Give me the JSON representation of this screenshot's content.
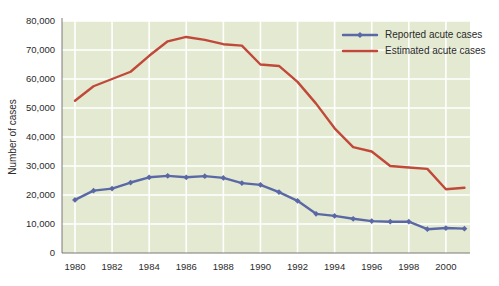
{
  "chart_data": {
    "type": "line",
    "title": "",
    "xlabel": "",
    "ylabel": "Number of cases",
    "xlim": [
      1979.3,
      2001.3
    ],
    "ylim": [
      0,
      80000
    ],
    "grid": true,
    "legend_position": "top-right",
    "x_ticks": [
      1980,
      1982,
      1984,
      1986,
      1988,
      1990,
      1992,
      1994,
      1996,
      1998,
      2000
    ],
    "x_tick_labels": [
      "1980",
      "1982",
      "1984",
      "1986",
      "1988",
      "1990",
      "1992",
      "1994",
      "1996",
      "1998",
      "2000"
    ],
    "y_ticks": [
      0,
      10000,
      20000,
      30000,
      40000,
      50000,
      60000,
      70000,
      80000
    ],
    "y_tick_labels": [
      "0",
      "10,000",
      "20,000",
      "30,000",
      "40,000",
      "50,000",
      "60,000",
      "70,000",
      "80,000"
    ],
    "x": [
      1980,
      1981,
      1982,
      1983,
      1984,
      1985,
      1986,
      1987,
      1988,
      1989,
      1990,
      1991,
      1992,
      1993,
      1994,
      1995,
      1996,
      1997,
      1998,
      1999,
      2000,
      2001
    ],
    "series": [
      {
        "name": "Reported acute cases",
        "color": "#5b68a6",
        "marker": "diamond",
        "values": [
          18300,
          21500,
          22200,
          24300,
          26100,
          26600,
          26100,
          26500,
          25900,
          24100,
          23500,
          21000,
          18000,
          13500,
          12800,
          11800,
          11000,
          10800,
          10800,
          8200,
          8600,
          8400
        ]
      },
      {
        "name": "Estimated acute cases",
        "color": "#c0493a",
        "marker": "none",
        "values": [
          52500,
          57500,
          60000,
          62500,
          68000,
          73000,
          74500,
          73500,
          72000,
          71500,
          65000,
          64500,
          59000,
          51500,
          43000,
          36500,
          35000,
          30000,
          29500,
          29000,
          22000,
          22500
        ]
      }
    ]
  },
  "legend": {
    "items": [
      {
        "label": "Reported acute cases"
      },
      {
        "label": "Estimated acute cases"
      }
    ]
  },
  "axes": {
    "y_title": "Number of cases"
  }
}
